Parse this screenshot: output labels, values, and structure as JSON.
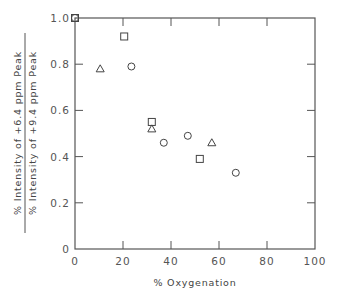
{
  "chart_data": {
    "type": "scatter",
    "title": "",
    "xlabel": "% Oxygenation",
    "ylabel": {
      "numerator": "% Intensity of +6.4 ppm Peak",
      "denominator": "% Intensity of +9.4 ppm Peak"
    },
    "xlim": [
      0,
      100
    ],
    "ylim": [
      0,
      1.0
    ],
    "xticks": [
      0,
      20,
      40,
      60,
      80,
      100
    ],
    "xtick_labels": [
      "0",
      "20",
      "40",
      "60",
      "80",
      "100"
    ],
    "yticks": [
      0,
      0.2,
      0.4,
      0.6,
      0.8,
      1.0
    ],
    "ytick_labels": [
      "0",
      "0.2",
      "0.4",
      "0.6",
      "0.8",
      "1.0"
    ],
    "origin_label": "0",
    "grid": false,
    "frame": "box",
    "legend": null,
    "series": [
      {
        "name": "squares",
        "marker": "square",
        "points": [
          {
            "x": 0,
            "y": 1.0
          },
          {
            "x": 20.5,
            "y": 0.92
          },
          {
            "x": 32,
            "y": 0.55
          },
          {
            "x": 52,
            "y": 0.39
          }
        ]
      },
      {
        "name": "triangles",
        "marker": "triangle",
        "points": [
          {
            "x": 10.5,
            "y": 0.78
          },
          {
            "x": 32,
            "y": 0.52
          },
          {
            "x": 57,
            "y": 0.46
          }
        ]
      },
      {
        "name": "circles",
        "marker": "circle",
        "points": [
          {
            "x": 0,
            "y": 1.0
          },
          {
            "x": 23.5,
            "y": 0.79
          },
          {
            "x": 37,
            "y": 0.46
          },
          {
            "x": 47,
            "y": 0.49
          },
          {
            "x": 67,
            "y": 0.33
          }
        ]
      }
    ]
  },
  "colors": {
    "ink": "#444444",
    "background": "#ffffff"
  }
}
